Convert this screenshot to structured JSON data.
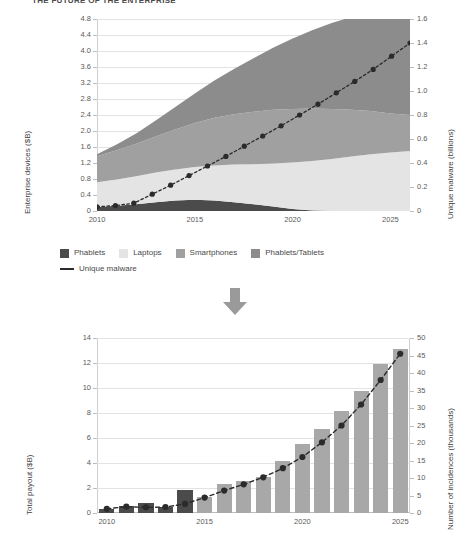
{
  "page": {
    "title": "THE FUTURE OF THE ENTERPRISE",
    "background": "#ffffff"
  },
  "colors": {
    "phablets": "#4b4b4b",
    "laptops": "#e4e4e4",
    "smartphones": "#a0a0a0",
    "phablets_tablets": "#8c8c8c",
    "line": "#2b2b2b",
    "bar_dark": "#4b4b4b",
    "bar_light": "#a8a8a8",
    "grid": "#e3e3e3",
    "axis": "#bdbdbd",
    "arrow": "#9a9a9a",
    "text": "#4a4a4a"
  },
  "legend": {
    "row1": [
      {
        "label": "Phablets",
        "swatch": "#4b4b4b",
        "type": "swatch"
      },
      {
        "label": "Laptops",
        "swatch": "#e4e4e4",
        "type": "swatch"
      },
      {
        "label": "Smartphones",
        "swatch": "#a0a0a0",
        "type": "swatch"
      },
      {
        "label": "Phablets/Tablets",
        "swatch": "#8c8c8c",
        "type": "swatch"
      }
    ],
    "row2": [
      {
        "label": "Unique malware",
        "swatch": "#2b2b2b",
        "type": "line"
      }
    ]
  },
  "arrow": {
    "name": "down-arrow",
    "color": "#9a9a9a"
  },
  "chart_data": [
    {
      "id": "enterprise-devices-chart",
      "type": "area",
      "title": "",
      "xlabel": "",
      "ylabel": "Enterprise devices ($B)",
      "y2label": "Unique malware (billions)",
      "grid": true,
      "legend_position": "below",
      "x": [
        2010,
        2011,
        2012,
        2013,
        2014,
        2015,
        2016,
        2017,
        2018,
        2019,
        2020,
        2021,
        2022,
        2023,
        2024,
        2025,
        2026
      ],
      "xticks": [
        2010,
        2015,
        2020,
        2025
      ],
      "ylim": [
        0,
        4.8
      ],
      "yticks": [
        0,
        0.4,
        0.8,
        1.2,
        1.6,
        2.0,
        2.4,
        2.8,
        3.2,
        3.6,
        4.0,
        4.4,
        4.8
      ],
      "yticklabels": [
        "0",
        "0.4",
        "0.8",
        "1.2",
        "1.6",
        "2.0",
        "2.4",
        "2.8",
        "3.2",
        "3.6",
        "4.0",
        "4.4",
        "4.8"
      ],
      "y2lim": [
        0,
        1.6
      ],
      "y2ticks": [
        0,
        0.2,
        0.4,
        0.6,
        0.8,
        1.0,
        1.2,
        1.4,
        1.6
      ],
      "y2ticklabels": [
        "0",
        "0.2",
        "0.4",
        "0.6",
        "0.8",
        "1.0",
        "1.2",
        "1.4",
        "1.6"
      ],
      "stack_order": [
        "Phablets",
        "Laptops",
        "Smartphones",
        "Phablets/Tablets"
      ],
      "series": [
        {
          "name": "Phablets",
          "color": "#4b4b4b",
          "values": [
            0.1,
            0.13,
            0.17,
            0.22,
            0.26,
            0.28,
            0.26,
            0.22,
            0.17,
            0.11,
            0.05,
            0.01,
            0.0,
            0.0,
            0.0,
            0.0,
            0.0
          ]
        },
        {
          "name": "Laptops",
          "color": "#e4e4e4",
          "values": [
            0.62,
            0.66,
            0.7,
            0.74,
            0.78,
            0.82,
            0.88,
            0.94,
            1.0,
            1.08,
            1.16,
            1.24,
            1.3,
            1.36,
            1.42,
            1.46,
            1.5
          ]
        },
        {
          "name": "Smartphones",
          "color": "#a0a0a0",
          "values": [
            0.65,
            0.73,
            0.81,
            0.9,
            1.0,
            1.1,
            1.19,
            1.26,
            1.31,
            1.34,
            1.34,
            1.31,
            1.25,
            1.17,
            1.08,
            0.98,
            0.9
          ]
        },
        {
          "name": "Phablets/Tablets",
          "color": "#8c8c8c",
          "values": [
            0.05,
            0.14,
            0.26,
            0.4,
            0.56,
            0.74,
            0.93,
            1.13,
            1.34,
            1.55,
            1.76,
            1.96,
            2.15,
            2.32,
            2.47,
            2.58,
            2.62
          ]
        }
      ],
      "line_series": {
        "name": "Unique malware",
        "color": "#2b2b2b",
        "axis": "right",
        "style": "dotted",
        "marker": "circle",
        "values": [
          0.035,
          0.045,
          0.065,
          0.14,
          0.215,
          0.295,
          0.375,
          0.455,
          0.54,
          0.625,
          0.71,
          0.8,
          0.89,
          0.985,
          1.08,
          1.18,
          1.29,
          1.4
        ]
      }
    },
    {
      "id": "total-payout-chart",
      "type": "bar",
      "title": "",
      "xlabel": "",
      "ylabel": "Total payout ($B)",
      "y2label": "Number of incidences (thousands)",
      "grid": true,
      "categories": [
        2010,
        2011,
        2012,
        2013,
        2014,
        2015,
        2016,
        2017,
        2018,
        2019,
        2020,
        2021,
        2022,
        2023,
        2024,
        2025
      ],
      "xticks": [
        2010,
        2015,
        2020,
        2025
      ],
      "ylim": [
        0,
        14
      ],
      "yticks": [
        0,
        2,
        4,
        6,
        8,
        10,
        12,
        14
      ],
      "yticklabels": [
        "0",
        "2",
        "4",
        "6",
        "8",
        "10",
        "12",
        "14"
      ],
      "y2lim": [
        0,
        50
      ],
      "y2ticks": [
        0,
        5,
        10,
        15,
        20,
        25,
        30,
        35,
        40,
        45,
        50
      ],
      "y2ticklabels": [
        "0",
        "5",
        "10",
        "15",
        "20",
        "25",
        "30",
        "35",
        "40",
        "45",
        "50"
      ],
      "bars": {
        "name": "Total payout",
        "values": [
          0.35,
          0.55,
          0.8,
          0.45,
          1.85,
          1.3,
          2.35,
          2.55,
          2.85,
          4.2,
          5.55,
          6.7,
          8.2,
          9.8,
          11.9,
          13.1
        ],
        "colors": [
          "#4b4b4b",
          "#4b4b4b",
          "#4b4b4b",
          "#4b4b4b",
          "#4b4b4b",
          "#a8a8a8",
          "#a8a8a8",
          "#a8a8a8",
          "#a8a8a8",
          "#a8a8a8",
          "#a8a8a8",
          "#a8a8a8",
          "#a8a8a8",
          "#a8a8a8",
          "#a8a8a8",
          "#a8a8a8"
        ]
      },
      "line_series": {
        "name": "Number of incidences",
        "color": "#2b2b2b",
        "axis": "right",
        "style": "dashed",
        "marker": "circle",
        "values": [
          1.2,
          1.8,
          1.6,
          1.7,
          2.6,
          4.4,
          6.4,
          8.2,
          10.2,
          12.8,
          16.0,
          20.2,
          25.0,
          31.0,
          38.0,
          45.5
        ]
      }
    }
  ]
}
